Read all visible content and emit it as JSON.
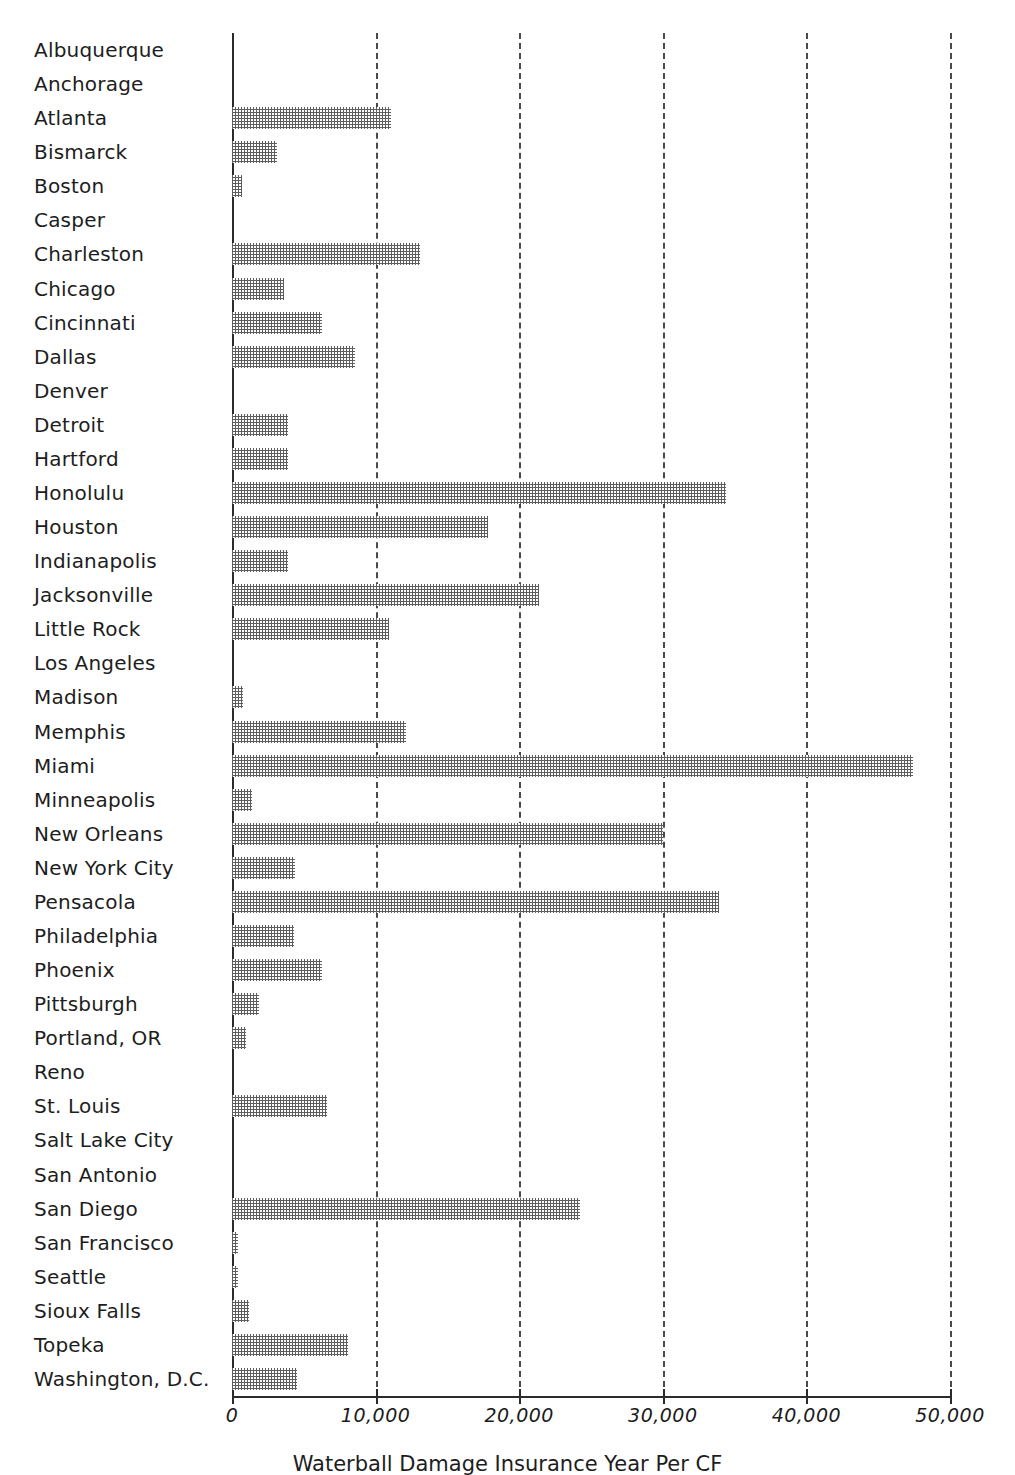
{
  "chart_data": {
    "type": "bar",
    "orientation": "horizontal",
    "title": "",
    "xlabel": "Waterball Damage Insurance Year Per CF",
    "ylabel": "",
    "xlim": [
      0,
      52000
    ],
    "grid": true,
    "gridline_style": "dashed",
    "legend": null,
    "xticks": [
      0,
      10000,
      20000,
      30000,
      40000,
      50000
    ],
    "xtick_labels": [
      "0",
      "10,000",
      "20,000",
      "30,000",
      "40,000",
      "50,000"
    ],
    "categories": [
      "Albuquerque",
      "Anchorage",
      "Atlanta",
      "Bismarck",
      "Boston",
      "Casper",
      "Charleston",
      "Chicago",
      "Cincinnati",
      "Dallas",
      "Denver",
      "Detroit",
      "Hartford",
      "Honolulu",
      "Houston",
      "Indianapolis",
      "Jacksonville",
      "Little Rock",
      "Los Angeles",
      "Madison",
      "Memphis",
      "Miami",
      "Minneapolis",
      "New Orleans",
      "New York City",
      "Pensacola",
      "Philadelphia",
      "Phoenix",
      "Pittsburgh",
      "Portland, OR",
      "Reno",
      "St. Louis",
      "Salt Lake City",
      "San Antonio",
      "San Diego",
      "San Francisco",
      "Seattle",
      "Sioux Falls",
      "Topeka",
      "Washington, D.C."
    ],
    "values": [
      0,
      0,
      11100,
      3100,
      700,
      0,
      13100,
      3600,
      6300,
      8600,
      0,
      3900,
      3900,
      34400,
      17800,
      3900,
      21400,
      10900,
      0,
      800,
      12100,
      47400,
      1400,
      30000,
      4400,
      33900,
      4300,
      6300,
      1900,
      1000,
      0,
      6600,
      0,
      0,
      24200,
      400,
      400,
      1200,
      8100,
      4500
    ]
  }
}
